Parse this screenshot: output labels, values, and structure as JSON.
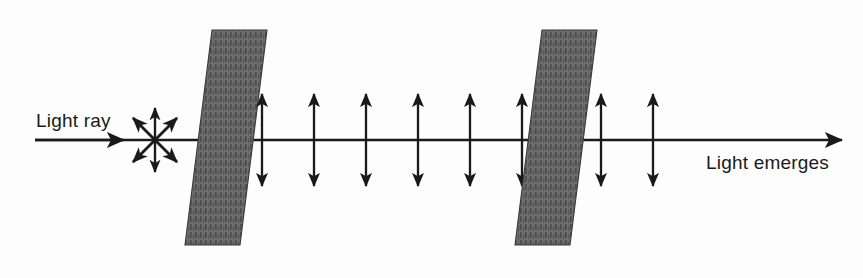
{
  "figure": {
    "type": "physics-diagram",
    "width": 863,
    "height": 278,
    "background_color": "#fdfdfd"
  },
  "labels": {
    "incoming": "Light ray",
    "outgoing": "Light emerges"
  },
  "colors": {
    "line": "#1a1a1a",
    "filter_fill": "#6e6e6e",
    "filter_stripe": "#4a4a4a",
    "filter_edge": "#3a3a3a",
    "text": "#1a1a1a"
  },
  "axis": {
    "name": "optical-axis",
    "y": 140,
    "x_start": 35,
    "x_end": 842,
    "stroke_width": 2.6,
    "arrowhead": "right"
  },
  "incoming_ray": {
    "x_start": 35,
    "x_end": 200,
    "arrowhead_x": 118,
    "description": "unpolarized light ray travelling to the right"
  },
  "unpolarized_burst": {
    "name": "unpolarized-light-burst",
    "center_x": 155,
    "center_y": 140,
    "ray_count": 8,
    "radius": 34,
    "diagonal_radius": 30,
    "angles_deg": [
      90,
      45,
      0,
      315,
      270,
      225,
      180,
      135
    ],
    "description": "star of double-headed arrows showing vibration in all planes"
  },
  "filters": [
    {
      "name": "polarizing-filter-1",
      "label": "First polarizing filter",
      "x_bottom_left": 185,
      "x_top_left": 212,
      "width": 55,
      "y_top": 30,
      "y_bottom": 245,
      "slant_px": 27,
      "stripe_spacing": 5,
      "transmission_axis": "vertical"
    },
    {
      "name": "polarizing-filter-2",
      "label": "Second polarizing filter",
      "x_bottom_left": 515,
      "x_top_left": 542,
      "width": 55,
      "y_top": 30,
      "y_bottom": 245,
      "slant_px": 27,
      "stripe_spacing": 5,
      "transmission_axis": "vertical"
    }
  ],
  "polarized_arrows": {
    "name": "vertical-polarization-arrows",
    "description": "double-headed vertical arrows indicating light polarized in the vertical plane",
    "half_length": 46,
    "between_filters": {
      "count": 6,
      "x_positions": [
        262,
        314,
        366,
        418,
        470,
        522
      ]
    },
    "after_second_filter": {
      "count": 2,
      "x_positions": [
        601,
        653
      ]
    }
  }
}
